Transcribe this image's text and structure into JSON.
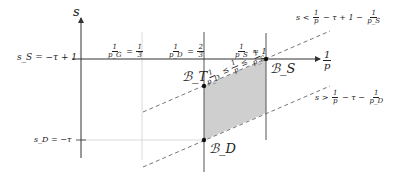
{
  "diagram": {
    "axes": {
      "y_label": "s",
      "x_label_num": "1",
      "x_label_den": "p"
    },
    "left_labels": {
      "s_S": "s_S = −τ + 1",
      "s_D": "s_D = −τ"
    },
    "vertical_labels": {
      "pG": {
        "num": "1",
        "den": "p_G",
        "eq": "=",
        "val_num": "1",
        "val_den": "3"
      },
      "pD": {
        "num": "1",
        "den": "p_D",
        "eq": "=",
        "val_num": "2",
        "val_den": "3"
      },
      "pS": {
        "num": "1",
        "den": "p_S",
        "eq": "≈ 1"
      }
    },
    "points": {
      "B_T": "ℬ_T",
      "B_S": "ℬ_S",
      "B_D": "ℬ_D"
    },
    "region_label": {
      "left_num": "1",
      "left_den": "p_D",
      "mid_num": "1",
      "mid_den": "p",
      "right_num": "1",
      "right_den": "p_S",
      "rel": "≤"
    },
    "constraints": {
      "upper": {
        "prefix": "s <",
        "n1": "1",
        "d1": "p",
        "mid": "− τ + 1 −",
        "n2": "1",
        "d2": "p_S"
      },
      "lower": {
        "prefix": "s >",
        "n1": "1",
        "d1": "p",
        "mid": "− τ −",
        "n2": "1",
        "d2": "p_D"
      }
    },
    "colors": {
      "axis": "#333333",
      "guide": "#cccccc",
      "shade": "#cfcfcf",
      "dash": "#666666"
    }
  }
}
